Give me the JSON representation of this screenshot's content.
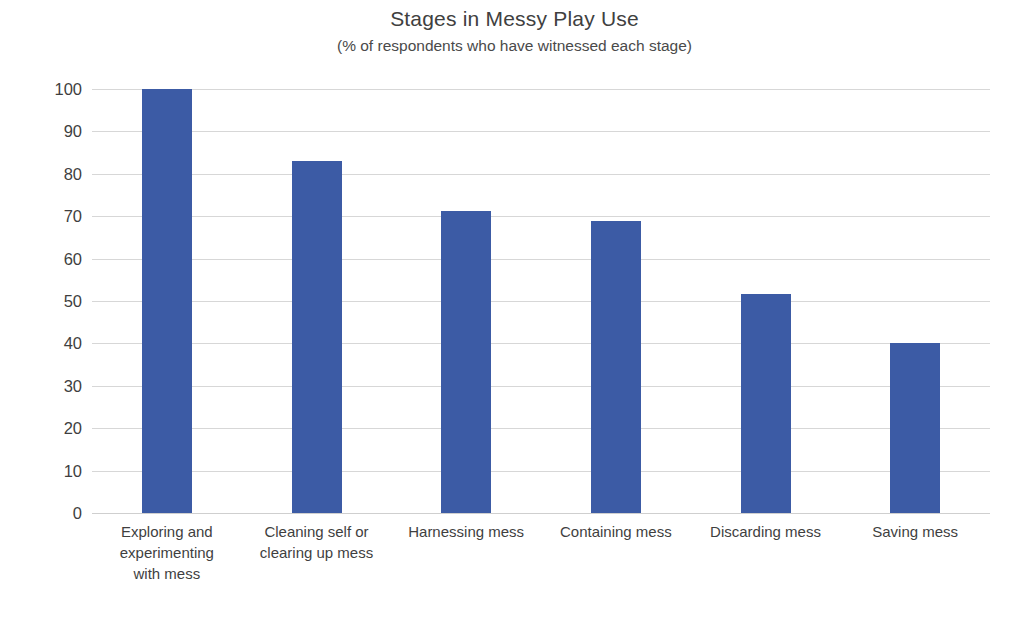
{
  "chart_data": {
    "type": "bar",
    "title": "Stages in Messy Play Use",
    "subtitle": "(% of respondents who have witnessed each stage)",
    "xlabel": "",
    "ylabel": "",
    "ylim": [
      0,
      100
    ],
    "ytick_step": 10,
    "yticks": [
      "100",
      "90",
      "80",
      "70",
      "60",
      "50",
      "40",
      "30",
      "20",
      "10",
      "0"
    ],
    "grid": true,
    "legend": "none",
    "bar_color": "#3c5ba5",
    "gridline_color": "#d7d7d7",
    "categories": [
      "Exploring and experimenting with mess",
      "Cleaning self or clearing up mess",
      "Harnessing mess",
      "Containing mess",
      "Discarding mess",
      "Saving mess"
    ],
    "category_lines": [
      [
        "Exploring and",
        "experimenting",
        "with mess"
      ],
      [
        "Cleaning self or",
        "clearing up mess"
      ],
      [
        "Harnessing mess"
      ],
      [
        "Containing mess"
      ],
      [
        "Discarding mess"
      ],
      [
        "Saving mess"
      ]
    ],
    "values": [
      100,
      83,
      71.3,
      68.8,
      51.7,
      40
    ]
  }
}
